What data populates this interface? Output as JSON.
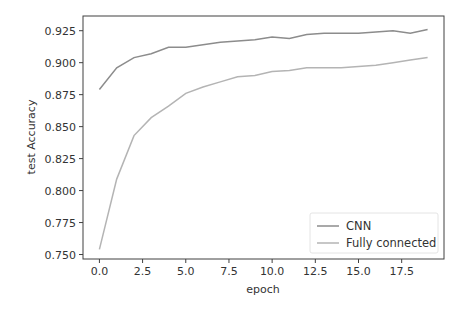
{
  "chart_data": {
    "type": "line",
    "title": "",
    "xlabel": "epoch",
    "ylabel": "test Accuracy",
    "xlim": [
      -0.95,
      19.95
    ],
    "ylim": [
      0.7465,
      0.9365
    ],
    "x_ticks": [
      0.0,
      2.5,
      5.0,
      7.5,
      10.0,
      12.5,
      15.0,
      17.5
    ],
    "x_tick_labels": [
      "0.0",
      "2.5",
      "5.0",
      "7.5",
      "10.0",
      "12.5",
      "15.0",
      "17.5"
    ],
    "y_ticks": [
      0.75,
      0.775,
      0.8,
      0.825,
      0.85,
      0.875,
      0.9,
      0.925
    ],
    "y_tick_labels": [
      "0.750",
      "0.775",
      "0.800",
      "0.825",
      "0.850",
      "0.875",
      "0.900",
      "0.925"
    ],
    "grid": false,
    "legend_position": "lower right",
    "x": [
      0,
      1,
      2,
      3,
      4,
      5,
      6,
      7,
      8,
      9,
      10,
      11,
      12,
      13,
      14,
      15,
      16,
      17,
      18,
      19
    ],
    "series": [
      {
        "name": "CNN",
        "color": "#8c8c8c",
        "values": [
          0.879,
          0.896,
          0.904,
          0.907,
          0.912,
          0.912,
          0.914,
          0.916,
          0.917,
          0.918,
          0.92,
          0.919,
          0.922,
          0.923,
          0.923,
          0.923,
          0.924,
          0.925,
          0.923,
          0.926
        ]
      },
      {
        "name": "Fully connected",
        "color": "#b4b4b4",
        "values": [
          0.754,
          0.809,
          0.843,
          0.857,
          0.866,
          0.876,
          0.881,
          0.885,
          0.889,
          0.89,
          0.893,
          0.894,
          0.896,
          0.896,
          0.896,
          0.897,
          0.898,
          0.9,
          0.902,
          0.904
        ]
      }
    ]
  },
  "layout": {
    "axes_color": "#404040",
    "text_color": "#333333"
  }
}
